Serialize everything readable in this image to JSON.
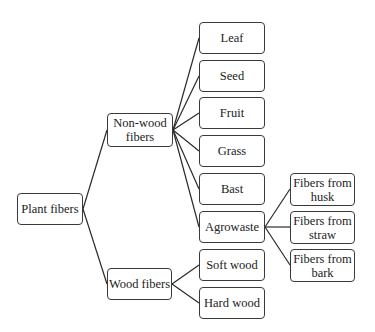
{
  "diagram": {
    "type": "tree",
    "root": {
      "id": "plant",
      "label": "Plant fibers"
    },
    "nodes": [
      {
        "id": "plant",
        "label": "Plant fibers"
      },
      {
        "id": "nonwood",
        "label": "Non-wood fibers",
        "line1": "Non-wood",
        "line2": "fibers"
      },
      {
        "id": "wood",
        "label": "Wood fibers"
      },
      {
        "id": "leaf",
        "label": "Leaf"
      },
      {
        "id": "seed",
        "label": "Seed"
      },
      {
        "id": "fruit",
        "label": "Fruit"
      },
      {
        "id": "grass",
        "label": "Grass"
      },
      {
        "id": "bast",
        "label": "Bast"
      },
      {
        "id": "agrowaste",
        "label": "Agrowaste"
      },
      {
        "id": "softwood",
        "label": "Soft wood"
      },
      {
        "id": "hardwood",
        "label": "Hard wood"
      },
      {
        "id": "husk",
        "label": "Fibers from husk",
        "line1": "Fibers from",
        "line2": "husk"
      },
      {
        "id": "straw",
        "label": "Fibers from straw",
        "line1": "Fibers from",
        "line2": "straw"
      },
      {
        "id": "bark",
        "label": "Fibers from bark",
        "line1": "Fibers from",
        "line2": "bark"
      }
    ],
    "edges": [
      [
        "plant",
        "nonwood"
      ],
      [
        "plant",
        "wood"
      ],
      [
        "nonwood",
        "leaf"
      ],
      [
        "nonwood",
        "seed"
      ],
      [
        "nonwood",
        "fruit"
      ],
      [
        "nonwood",
        "grass"
      ],
      [
        "nonwood",
        "bast"
      ],
      [
        "nonwood",
        "agrowaste"
      ],
      [
        "wood",
        "softwood"
      ],
      [
        "wood",
        "hardwood"
      ],
      [
        "agrowaste",
        "husk"
      ],
      [
        "agrowaste",
        "straw"
      ],
      [
        "agrowaste",
        "bark"
      ]
    ]
  }
}
